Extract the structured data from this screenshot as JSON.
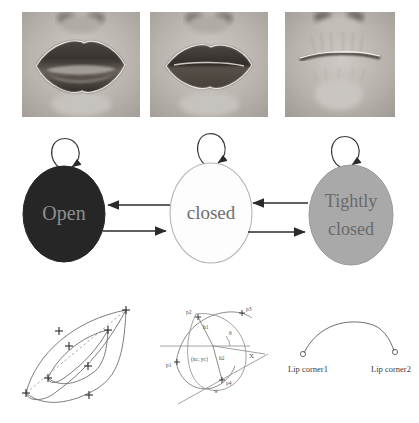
{
  "figure": {
    "kind": "lip-state-figure",
    "background": "#ffffff"
  },
  "photo_row": {
    "name": "mouth-appearance-samples",
    "items": [
      {
        "id": "photo-open",
        "caption": "",
        "state": "Open"
      },
      {
        "id": "photo-closed",
        "caption": "",
        "state": "closed"
      },
      {
        "id": "photo-tightly-closed",
        "caption": "",
        "state": "Tightly closed"
      }
    ]
  },
  "state_diagram": {
    "name": "lip-state-machine",
    "states": [
      {
        "id": "state-open",
        "label": "Open",
        "fill": "#262626",
        "text_color": "#8f8f8f",
        "stroke": "#262626"
      },
      {
        "id": "state-closed",
        "label": "closed",
        "fill": "#fdfdfd",
        "text_color": "#6d6d6d",
        "stroke": "#b5b5b5"
      },
      {
        "id": "state-tightly-closed",
        "label_line1": "Tightly",
        "label_line2": "closed",
        "fill": "#a9a9a9",
        "text_color": "#6a6a6a",
        "stroke": "#9a9a9a"
      }
    ],
    "self_loops": [
      {
        "id": "self-loop-open",
        "for": "state-open"
      },
      {
        "id": "self-loop-closed",
        "for": "state-closed"
      },
      {
        "id": "self-loop-tightly-closed",
        "for": "state-tightly-closed"
      }
    ],
    "transitions": [
      {
        "id": "t-closed-to-open",
        "from": "state-closed",
        "to": "state-open",
        "direction": "left"
      },
      {
        "id": "t-open-to-closed",
        "from": "state-open",
        "to": "state-closed",
        "direction": "right"
      },
      {
        "id": "t-tightly-closed-to-closed",
        "from": "state-tightly-closed",
        "to": "state-closed",
        "direction": "left"
      },
      {
        "id": "t-closed-to-tightly-closed",
        "from": "state-closed",
        "to": "state-tightly-closed",
        "direction": "right"
      }
    ],
    "arrow_color": "#2b2b2b"
  },
  "geometry_row": {
    "name": "lip-geometry-models",
    "panels": [
      {
        "id": "panel-contour-model",
        "title": "",
        "marker_glyph": "+",
        "marker_count": 8,
        "stroke": "#6e6e6e",
        "dashed_axis": true
      },
      {
        "id": "panel-parametric-model",
        "stroke": "#6e6e6e",
        "labels": [
          {
            "id": "label-p2",
            "text": "p2"
          },
          {
            "id": "label-p3",
            "text": "p3"
          },
          {
            "id": "label-p1",
            "text": "p1"
          },
          {
            "id": "label-p4",
            "text": "p4"
          },
          {
            "id": "label-h1",
            "text": "h1"
          },
          {
            "id": "label-h2",
            "text": "h2"
          },
          {
            "id": "label-center",
            "text": "(xc, yc)"
          },
          {
            "id": "label-theta",
            "text": "θ"
          },
          {
            "id": "label-x-axis",
            "text": "X"
          },
          {
            "id": "label-w",
            "text": "w"
          }
        ]
      },
      {
        "id": "panel-lip-corners",
        "stroke": "#6e6e6e",
        "labels": [
          {
            "id": "label-lip-corner-1",
            "text": "Lip corner1"
          },
          {
            "id": "label-lip-corner-2",
            "text": "Lip corner2"
          }
        ]
      }
    ]
  }
}
